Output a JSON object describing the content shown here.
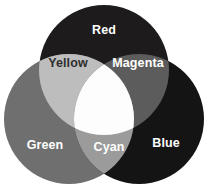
{
  "diagram": {
    "type": "venn-3-circle",
    "canvas": {
      "width": 208,
      "height": 193,
      "background": "#ffffff"
    },
    "circles": [
      {
        "id": "red",
        "label": "Red",
        "color": "#1d1b1b",
        "cx": 104,
        "cy": 70,
        "r": 65,
        "label_x": 104,
        "label_y": 30,
        "label_color": "#ffffff"
      },
      {
        "id": "green",
        "label": "Green",
        "color": "#6f6f6f",
        "cx": 69,
        "cy": 119,
        "r": 65,
        "label_x": 45,
        "label_y": 145,
        "label_color": "#ffffff"
      },
      {
        "id": "blue",
        "label": "Blue",
        "color": "#141414",
        "cx": 139,
        "cy": 119,
        "r": 65,
        "label_x": 166,
        "label_y": 143,
        "label_color": "#ffffff"
      }
    ],
    "intersections": [
      {
        "id": "yellow",
        "label": "Yellow",
        "parents": [
          "red",
          "green"
        ],
        "color": "#bdbdbd",
        "label_x": 68,
        "label_y": 63,
        "label_color": "#2f2f2f"
      },
      {
        "id": "magenta",
        "label": "Magenta",
        "parents": [
          "red",
          "blue"
        ],
        "color": "#5c5c5c",
        "label_x": 138,
        "label_y": 63,
        "label_color": "#ffffff"
      },
      {
        "id": "cyan",
        "label": "Cyan",
        "parents": [
          "green",
          "blue"
        ],
        "color": "#9b9b9b",
        "label_x": 109,
        "label_y": 147,
        "label_color": "#ffffff"
      },
      {
        "id": "white",
        "label": "",
        "parents": [
          "red",
          "green",
          "blue"
        ],
        "color": "#fdfdfd",
        "label_x": 104,
        "label_y": 104,
        "label_color": "#000000"
      }
    ]
  },
  "chart_data": {
    "type": "diagram",
    "subtype": "venn",
    "sets": [
      "Red",
      "Green",
      "Blue"
    ],
    "regions": [
      {
        "name": "Red",
        "members": [
          "Red"
        ],
        "fill": "#1d1b1b"
      },
      {
        "name": "Green",
        "members": [
          "Green"
        ],
        "fill": "#6f6f6f"
      },
      {
        "name": "Blue",
        "members": [
          "Blue"
        ],
        "fill": "#141414"
      },
      {
        "name": "Yellow",
        "members": [
          "Red",
          "Green"
        ],
        "fill": "#bdbdbd"
      },
      {
        "name": "Magenta",
        "members": [
          "Red",
          "Blue"
        ],
        "fill": "#5c5c5c"
      },
      {
        "name": "Cyan",
        "members": [
          "Green",
          "Blue"
        ],
        "fill": "#9b9b9b"
      },
      {
        "name": "White",
        "members": [
          "Red",
          "Green",
          "Blue"
        ],
        "fill": "#fdfdfd"
      }
    ],
    "legend": null,
    "xlabel": "",
    "ylabel": ""
  }
}
